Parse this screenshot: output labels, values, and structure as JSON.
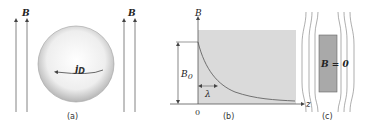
{
  "figure": {
    "panel_a": {
      "caption": "(a)",
      "field_label_left": "B",
      "field_label_right": "B",
      "current_label": "j",
      "current_subscript": "D"
    },
    "panel_b": {
      "caption": "(b)",
      "y_axis_label": "B",
      "x_axis_label": "z",
      "origin_label": "0",
      "amplitude_label": "B",
      "amplitude_subscript": "0",
      "penetration_depth_label": "λ"
    },
    "panel_c": {
      "caption": "(c)",
      "interior_label": "B = 0"
    },
    "colors": {
      "line": "#555555",
      "shade": "#d9d9d9",
      "sphere_edge": "#9a9a9a",
      "rect_fill": "#a9a9a9"
    }
  }
}
